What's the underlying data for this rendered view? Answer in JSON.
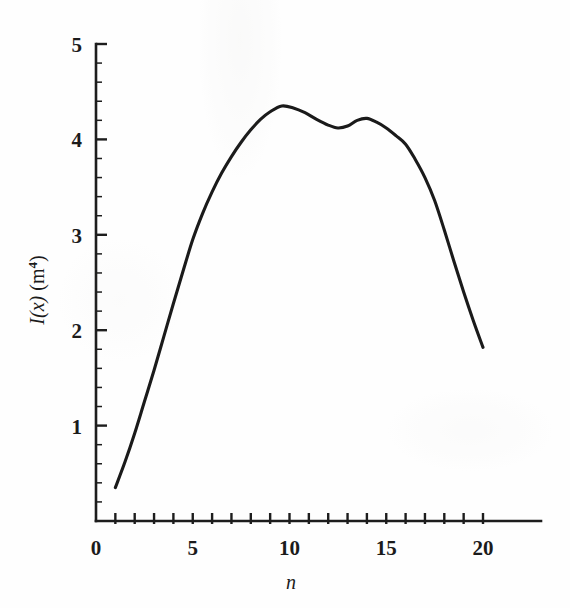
{
  "figure": {
    "background_color": "#fefefe",
    "ink_color": "#1a1a1a"
  },
  "axes": {
    "y_title_main": "I(x)",
    "y_title_unit": "(m",
    "y_title_exponent": "4",
    "y_title_unit_close": ")",
    "y_title_full": "I(x) (m⁴)",
    "x_title": "n"
  },
  "chart_data": {
    "type": "line",
    "title": "",
    "xlabel": "n",
    "ylabel": "I(x) (m⁴)",
    "xlim": [
      0,
      23
    ],
    "ylim": [
      0,
      5
    ],
    "grid": false,
    "legend": "none",
    "x_ticks_major": [
      0,
      5,
      10,
      15,
      20
    ],
    "x_tick_labels": [
      "0",
      "5",
      "10",
      "15",
      "20"
    ],
    "x_ticks_minor": [
      1,
      2,
      3,
      4,
      6,
      7,
      8,
      9,
      11,
      12,
      13,
      14,
      16,
      17,
      18,
      19
    ],
    "y_ticks_major": [
      1,
      2,
      3,
      4,
      5
    ],
    "y_tick_labels": [
      "1",
      "2",
      "3",
      "4",
      "5"
    ],
    "y_ticks_minor_step": 0.2,
    "series": [
      {
        "name": "I(x)",
        "color": "#1a1a1a",
        "x": [
          1.0,
          1.5,
          2.0,
          2.5,
          3.0,
          3.5,
          4.0,
          4.5,
          5.0,
          5.5,
          6.0,
          6.5,
          7.0,
          7.5,
          8.0,
          8.5,
          9.0,
          9.6,
          10.2,
          10.8,
          11.4,
          12.0,
          12.5,
          13.0,
          13.5,
          14.0,
          14.5,
          15.0,
          15.5,
          16.0,
          16.5,
          17.0,
          17.5,
          18.0,
          18.5,
          19.0,
          19.5,
          20.0
        ],
        "y": [
          0.35,
          0.62,
          0.92,
          1.25,
          1.58,
          1.93,
          2.28,
          2.62,
          2.95,
          3.22,
          3.45,
          3.65,
          3.82,
          3.97,
          4.1,
          4.21,
          4.29,
          4.35,
          4.33,
          4.28,
          4.21,
          4.15,
          4.12,
          4.14,
          4.2,
          4.22,
          4.18,
          4.12,
          4.04,
          3.95,
          3.79,
          3.6,
          3.36,
          3.05,
          2.72,
          2.4,
          2.1,
          1.82
        ]
      }
    ],
    "annotations": {
      "primary_peak": {
        "n": 9.6,
        "value": 4.35
      },
      "local_minimum": {
        "n": 12.5,
        "value": 4.12
      },
      "secondary_peak": {
        "n": 14.0,
        "value": 4.22
      },
      "start_point": {
        "n": 1.0,
        "value": 0.35
      },
      "end_point": {
        "n": 20.0,
        "value": 1.82
      }
    }
  }
}
